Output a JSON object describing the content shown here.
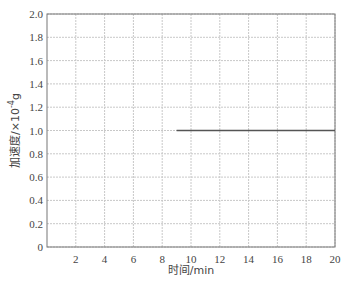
{
  "chart_data": {
    "type": "line",
    "title": "",
    "xlabel": "时间/min",
    "ylabel": "加速度/×10⁻⁴g",
    "ylabel_parts": {
      "main": "加速度/×10",
      "sup": "-4",
      "unit": "g"
    },
    "xlim": [
      0,
      20
    ],
    "ylim": [
      0,
      2.0
    ],
    "xticks": [
      2,
      4,
      6,
      8,
      10,
      12,
      14,
      16,
      18,
      20
    ],
    "xtick_labels": [
      "2",
      "4",
      "6",
      "8",
      "10",
      "12",
      "14",
      "16",
      "18",
      "20"
    ],
    "yticks": [
      0,
      0.2,
      0.4,
      0.6,
      0.8,
      1.0,
      1.2,
      1.4,
      1.6,
      1.8,
      2.0
    ],
    "ytick_labels": [
      "0",
      "0.2",
      "0.4",
      "0.6",
      "0.8",
      "1.0",
      "1.2",
      "1.4",
      "1.6",
      "1.8",
      "2.0"
    ],
    "grid": true,
    "legend": null,
    "series": [
      {
        "name": "acceleration",
        "x": [
          9.0,
          20.0
        ],
        "y": [
          1.0,
          1.0
        ],
        "color": "#555555"
      }
    ]
  },
  "colors": {
    "grid": "#c8c8c8",
    "axis": "#777777",
    "line": "#555555"
  }
}
